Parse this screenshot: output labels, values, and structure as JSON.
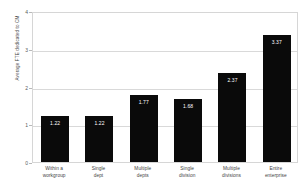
{
  "chart_data": {
    "type": "bar",
    "title": "",
    "xlabel": "",
    "ylabel": "Average FTE dedicated to CM",
    "ylim": [
      0,
      4
    ],
    "yticks": [
      "0",
      "1",
      "2",
      "3",
      "4"
    ],
    "grid": true,
    "legend": null,
    "bar_color": "#0a0a0a",
    "value_label_color": "#ffffff",
    "plot_border_color": "#d6d6d6",
    "gridline_color": "#d9d9d9",
    "background_color": "#ffffff",
    "categories": [
      "Within a workgroup",
      "Single dept",
      "Multiple depts",
      "Single division",
      "Multiple divisions",
      "Entire enterprise"
    ],
    "category_lines": [
      [
        "Within a",
        "workgroup"
      ],
      [
        "Single",
        "dept"
      ],
      [
        "Multiple",
        "depts"
      ],
      [
        "Single",
        "division"
      ],
      [
        "Multiple",
        "divisions"
      ],
      [
        "Entire",
        "enterprise"
      ]
    ],
    "values": [
      1.22,
      1.22,
      1.77,
      1.68,
      2.37,
      3.37
    ],
    "value_labels": [
      "1.22",
      "1.22",
      "1.77",
      "1.68",
      "2.37",
      "3.37"
    ]
  }
}
